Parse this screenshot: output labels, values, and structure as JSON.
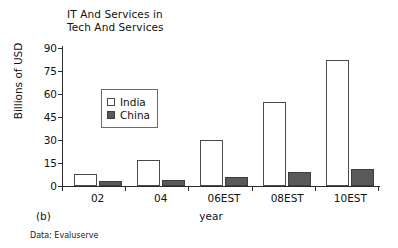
{
  "chart_data": {
    "type": "bar",
    "title": "IT And Services in\nTech And Services",
    "xlabel": "year",
    "ylabel": "Billions of USD",
    "categories": [
      "02",
      "04",
      "06EST",
      "08EST",
      "10EST"
    ],
    "series": [
      {
        "name": "India",
        "values": [
          8,
          17,
          30,
          55,
          82
        ],
        "color": "#ffffff"
      },
      {
        "name": "China",
        "values": [
          3,
          4,
          6,
          9,
          11
        ],
        "color": "#595959"
      }
    ],
    "ylim": [
      0,
      90
    ],
    "yticks": [
      0,
      15,
      30,
      45,
      60,
      75,
      90
    ],
    "grid": false,
    "legend_position": "upper-left-inside"
  },
  "panel_label": "(b)",
  "source_note": "Data: Evaluserve",
  "legend": {
    "india_label": "India",
    "china_label": "China"
  }
}
